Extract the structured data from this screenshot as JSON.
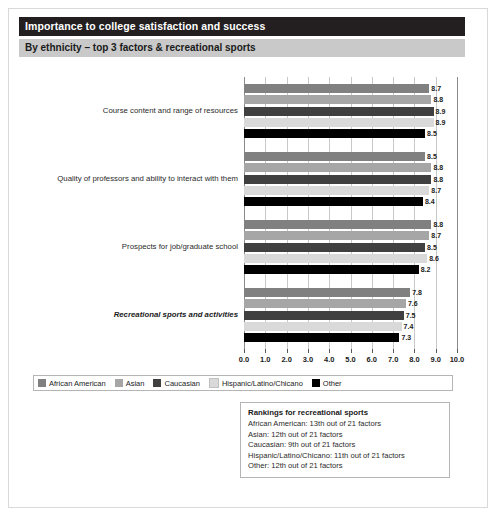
{
  "header": {
    "title": "Importance to college satisfaction and success",
    "subtitle": "By ethnicity – top 3 factors & recreational sports"
  },
  "legend": {
    "items": [
      {
        "label": "African American",
        "color": "#808080"
      },
      {
        "label": "Asian",
        "color": "#a6a6a6"
      },
      {
        "label": "Caucasian",
        "color": "#404040"
      },
      {
        "label": "Hispanic/Latino/Chicano",
        "color": "#d9d9d9"
      },
      {
        "label": "Other",
        "color": "#000000"
      }
    ]
  },
  "rankings": {
    "title": "Rankings for recreational sports",
    "lines": [
      "African American: 13th out of 21 factors",
      "Asian: 12th out of 21 factors",
      "Caucasian: 9th out of 21 factors",
      "Hispanic/Latino/Chicano: 11th out of 21 factors",
      "Other: 12th out of 21 factors"
    ]
  },
  "chart_data": {
    "type": "bar",
    "orientation": "horizontal",
    "title": "Importance to college satisfaction and success",
    "subtitle": "By ethnicity – top 3 factors & recreational sports",
    "xlabel": "",
    "ylabel": "",
    "xlim": [
      0.0,
      10.0
    ],
    "xticks": [
      "0.0",
      "1.0",
      "2.0",
      "3.0",
      "4.0",
      "5.0",
      "6.0",
      "7.0",
      "8.0",
      "9.0",
      "10.0"
    ],
    "grid": true,
    "legend_position": "bottom",
    "categories": [
      "Course content and range of resources",
      "Quality of professors and ability to interact with them",
      "Prospects for job/graduate school",
      "Recreational sports and activities"
    ],
    "emphasized_category": "Recreational sports and activities",
    "series": [
      {
        "name": "African American",
        "color": "#808080",
        "values": [
          8.7,
          8.5,
          8.8,
          7.8
        ]
      },
      {
        "name": "Asian",
        "color": "#a6a6a6",
        "values": [
          8.8,
          8.8,
          8.7,
          7.6
        ]
      },
      {
        "name": "Caucasian",
        "color": "#404040",
        "values": [
          8.9,
          8.8,
          8.5,
          7.5
        ]
      },
      {
        "name": "Hispanic/Latino/Chicano",
        "color": "#d9d9d9",
        "values": [
          8.9,
          8.7,
          8.6,
          7.4
        ]
      },
      {
        "name": "Other",
        "color": "#000000",
        "values": [
          8.5,
          8.4,
          8.2,
          7.3
        ]
      }
    ]
  }
}
